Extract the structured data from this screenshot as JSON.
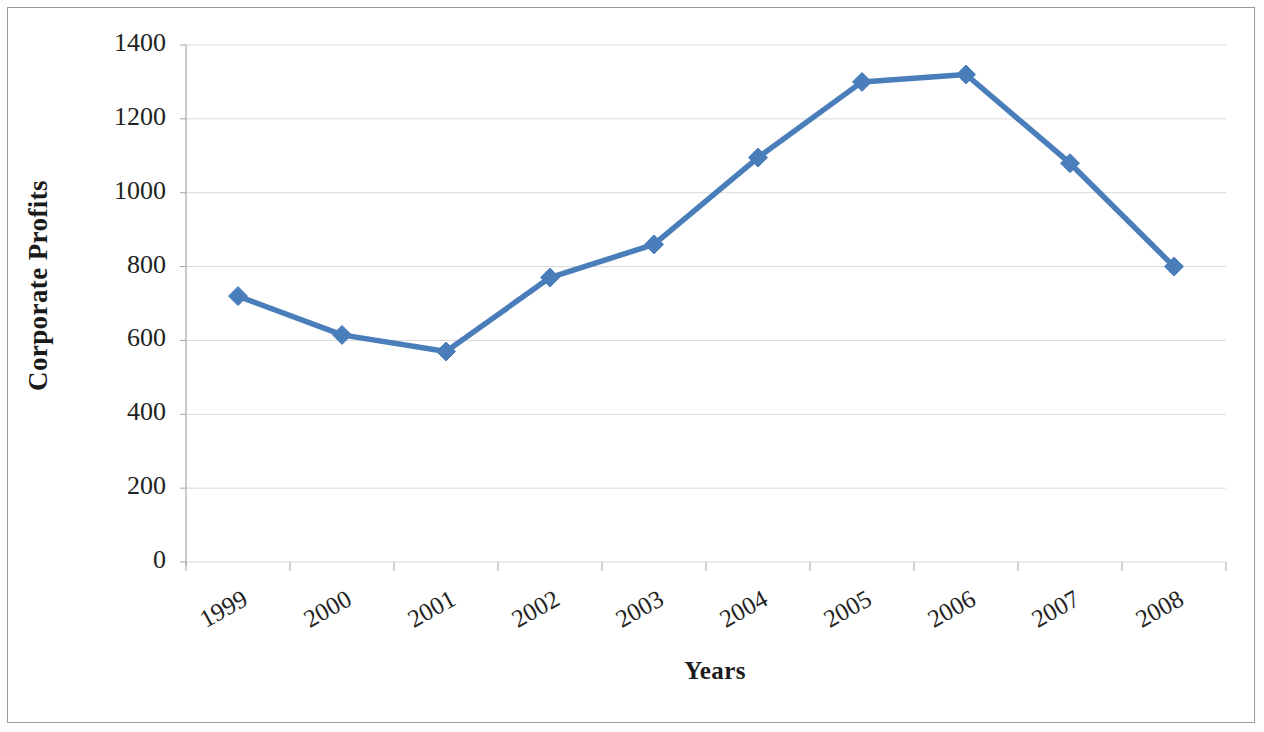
{
  "chart_data": {
    "type": "line",
    "title": "",
    "xlabel": "Years",
    "ylabel": "Corporate Profits",
    "categories": [
      "1999",
      "2000",
      "2001",
      "2002",
      "2003",
      "2004",
      "2005",
      "2006",
      "2007",
      "2008"
    ],
    "series": [
      {
        "name": "Corporate Profits",
        "color": "#4A7EBB",
        "marker": "diamond",
        "values": [
          720,
          615,
          570,
          770,
          860,
          1095,
          1300,
          1320,
          1080,
          800
        ]
      }
    ],
    "values": [
      720,
      615,
      570,
      770,
      860,
      1095,
      1300,
      1320,
      1080,
      800
    ],
    "ylim": [
      0,
      1400
    ],
    "ytick_labels": [
      "1400",
      "1200",
      "1000",
      "800",
      "600",
      "400",
      "200",
      "0"
    ],
    "ytick_values": [
      1400,
      1200,
      1000,
      800,
      600,
      400,
      200,
      0
    ],
    "xtick_labels": [
      "1999",
      "2000",
      "2001",
      "2002",
      "2003",
      "2004",
      "2005",
      "2006",
      "2007",
      "2008"
    ],
    "grid": "horizontal",
    "legend": "none",
    "xtick_rotation_deg": -29,
    "colors": {
      "line": "#4A7EBB",
      "marker": "#4A7EBB",
      "gridline": "#d9d9d9",
      "axis": "#a6a6a6",
      "frame": "#9a9a9a",
      "text": "#1b1b1b",
      "background": "#ffffff"
    }
  }
}
